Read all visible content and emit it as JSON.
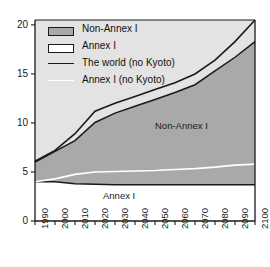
{
  "chart_data": {
    "type": "area",
    "title": "",
    "subtitle": "",
    "xlabel": "",
    "ylabel": "",
    "xlim": [
      1990,
      2100
    ],
    "ylim": [
      0,
      20.5
    ],
    "grid": false,
    "legend_position": "top-left",
    "x": [
      1990,
      2000,
      2010,
      2020,
      2030,
      2040,
      2050,
      2060,
      2070,
      2080,
      2090,
      2100
    ],
    "xticklabels": [
      "1990",
      "2000",
      "2010",
      "2020",
      "2030",
      "2040",
      "2050",
      "2060",
      "2070",
      "2080",
      "2090",
      "2100"
    ],
    "yticklabels": [
      "0",
      "5",
      "10",
      "15",
      "20"
    ],
    "yticks": [
      0,
      5,
      10,
      15,
      20
    ],
    "series": [
      {
        "name": "Annex I",
        "kind": "stacked-area",
        "fill": "#ffffff",
        "edge": "#1a1a1a",
        "values": [
          4.0,
          4.0,
          3.8,
          3.75,
          3.7,
          3.7,
          3.7,
          3.7,
          3.7,
          3.7,
          3.7,
          3.7
        ]
      },
      {
        "name": "Non-Annex I",
        "kind": "stacked-area",
        "fill": "#a9a9a9",
        "edge": "#1a1a1a",
        "values": [
          2.0,
          3.1,
          4.4,
          6.3,
          7.3,
          8.0,
          8.7,
          9.4,
          10.2,
          11.6,
          13.0,
          14.6
        ]
      },
      {
        "name": "The world (no Kyoto)",
        "kind": "line",
        "color": "#1a1a1a",
        "values": [
          6.1,
          7.2,
          8.9,
          11.2,
          12.0,
          12.7,
          13.4,
          14.1,
          15.0,
          16.4,
          18.3,
          20.5
        ]
      },
      {
        "name": "Annex I (no Kyoto)",
        "kind": "line",
        "color": "#ffffff",
        "values": [
          4.0,
          4.3,
          4.75,
          5.0,
          5.05,
          5.1,
          5.15,
          5.25,
          5.35,
          5.5,
          5.7,
          5.8
        ]
      }
    ],
    "stack_totals": [
      6.0,
      7.1,
      8.2,
      10.05,
      11.0,
      11.7,
      12.4,
      13.1,
      13.9,
      15.3,
      16.7,
      18.3
    ],
    "annotations": [
      {
        "text": "Non-Annex I",
        "x": 2058,
        "y": 9.4
      },
      {
        "text": "Annex I",
        "x": 2027,
        "y": 1.7
      }
    ],
    "legend": [
      {
        "label": "Non-Annex I",
        "type": "swatch",
        "fill": "#a9a9a9",
        "edge": "#1a1a1a"
      },
      {
        "label": "Annex I",
        "type": "swatch",
        "fill": "#ffffff",
        "edge": "#1a1a1a"
      },
      {
        "label": "The world (no Kyoto)",
        "type": "line",
        "color": "#1a1a1a"
      },
      {
        "label": "Annex I (no Kyoto)",
        "type": "line",
        "color": "#ffffff"
      }
    ]
  },
  "colors": {
    "plot_background": "#e3e3e3",
    "non_annex_fill": "#a9a9a9",
    "annex_fill": "#ffffff",
    "world_line": "#1a1a1a",
    "annex_no_kyoto_line": "#ffffff",
    "axis": "#1a1a1a",
    "page_background": "#ffffff"
  }
}
